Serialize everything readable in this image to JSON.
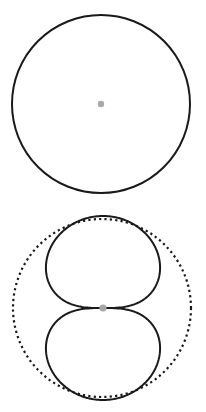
{
  "diagram": {
    "type": "polar-pattern-comparison",
    "canvas": {
      "width": 206,
      "height": 412
    },
    "colors": {
      "stroke": "#1a1a1a",
      "center_dot": "#a8a8a8",
      "background": "#ffffff"
    },
    "patterns": [
      {
        "name": "omnidirectional",
        "shape": "circle",
        "center": [
          101,
          104
        ],
        "radius": 89,
        "stroke_style": "solid",
        "stroke_width": 2
      },
      {
        "name": "reference-circle",
        "shape": "circle",
        "center": [
          102,
          308
        ],
        "radius": 89,
        "stroke_style": "dotted",
        "stroke_width": 2.2
      },
      {
        "name": "figure-eight",
        "shape": "polar",
        "formula": "r = R * |cos(theta)|^0.5, vertical axis",
        "center": [
          103,
          308
        ],
        "R": 92,
        "exponent": 0.5,
        "stroke_style": "solid",
        "stroke_width": 2
      }
    ],
    "center_dots": [
      {
        "name": "omni-center",
        "center": [
          101,
          104
        ],
        "radius": 3.2
      },
      {
        "name": "figure-eight-center",
        "center": [
          103,
          308
        ],
        "radius": 3.6
      }
    ]
  }
}
